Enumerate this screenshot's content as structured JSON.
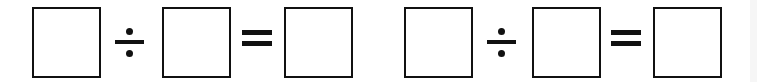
{
  "equations": [
    {
      "operand1": "",
      "operator": "÷",
      "operand2": "",
      "equals": "=",
      "result": ""
    },
    {
      "operand1": "",
      "operator": "÷",
      "operand2": "",
      "equals": "=",
      "result": ""
    }
  ],
  "icons": {
    "divide": "divide-sign",
    "equals": "equals-sign"
  }
}
